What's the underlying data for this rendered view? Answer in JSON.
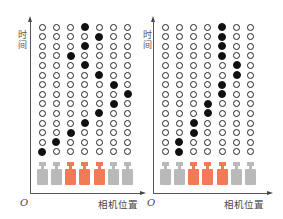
{
  "colors": {
    "camera_active": "#f07b56",
    "camera_inactive": "#b9b9b9",
    "dot_filled": "#111111",
    "dot_empty_border": "#222222"
  },
  "panels": [
    {
      "ylabel": "时间",
      "xlabel": "相机位置",
      "origin": "O",
      "columns": 7,
      "rows": 14,
      "filled_column_by_row_top_to_bottom": [
        4,
        5,
        4,
        3,
        4,
        5,
        6,
        7,
        6,
        5,
        4,
        3,
        2,
        1
      ],
      "cameras": [
        "inactive",
        "inactive",
        "active",
        "active",
        "active",
        "inactive",
        "inactive"
      ]
    },
    {
      "ylabel": "时间",
      "xlabel": "相机位置",
      "origin": "O",
      "columns": 7,
      "rows": 14,
      "filled_column_by_row_top_to_bottom": [
        5,
        5,
        5,
        5,
        6,
        6,
        5,
        5,
        4,
        4,
        3,
        3,
        2,
        2
      ],
      "cameras": [
        "inactive",
        "inactive",
        "active",
        "active",
        "active",
        "inactive",
        "inactive"
      ]
    }
  ]
}
